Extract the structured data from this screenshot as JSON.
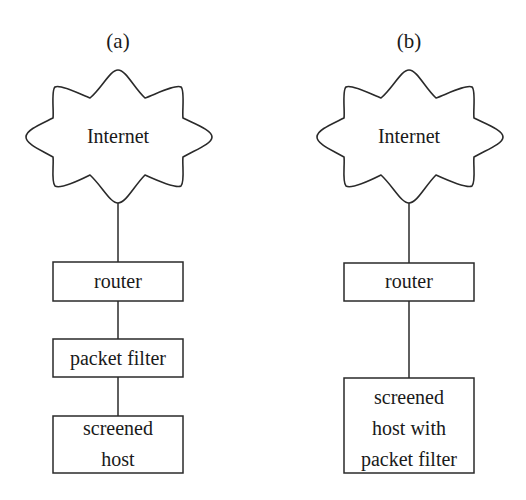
{
  "panels": [
    {
      "label": "(a)",
      "cloud": {
        "label": "Internet"
      },
      "nodes": [
        {
          "id": "router",
          "lines": [
            "router"
          ]
        },
        {
          "id": "packet-filter",
          "lines": [
            "packet filter"
          ]
        },
        {
          "id": "screened-host",
          "lines": [
            "screened",
            "host"
          ]
        }
      ]
    },
    {
      "label": "(b)",
      "cloud": {
        "label": "Internet"
      },
      "nodes": [
        {
          "id": "router",
          "lines": [
            "router"
          ]
        },
        {
          "id": "screened-host-with-packet-filter",
          "lines": [
            "screened",
            "host with",
            "packet filter"
          ]
        }
      ]
    }
  ],
  "colors": {
    "line": "#2a2a2a",
    "text": "#1a1a1a",
    "background": "#ffffff"
  }
}
